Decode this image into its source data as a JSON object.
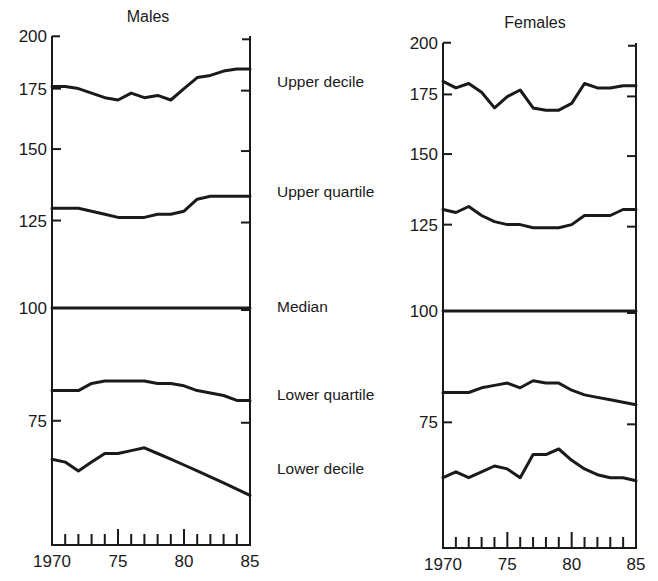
{
  "chart_data": [
    {
      "type": "line",
      "title": "Males",
      "xlabel": "",
      "ylabel": "",
      "yscale": "log",
      "ylim": [
        55,
        200
      ],
      "xlim": [
        1970,
        1985
      ],
      "yticks": [
        75,
        100,
        125,
        150,
        175,
        200
      ],
      "xtick_labels": [
        "1970",
        "75",
        "80",
        "85"
      ],
      "xticks": [
        1970,
        1975,
        1980,
        1985
      ],
      "minor_xticks_every": 1,
      "grid": false,
      "x": [
        1970,
        1971,
        1972,
        1973,
        1974,
        1975,
        1976,
        1977,
        1978,
        1979,
        1980,
        1981,
        1982,
        1983,
        1984,
        1985
      ],
      "series": [
        {
          "name": "Upper decile",
          "values": [
            176,
            176,
            175,
            173,
            171,
            170,
            173,
            171,
            172,
            170,
            175,
            180,
            181,
            183,
            184,
            184
          ]
        },
        {
          "name": "Upper quartile",
          "values": [
            129,
            129,
            129,
            128,
            127,
            126,
            126,
            126,
            127,
            127,
            128,
            132,
            133,
            133,
            133,
            133
          ]
        },
        {
          "name": "Median",
          "values": [
            100,
            100,
            100,
            100,
            100,
            100,
            100,
            100,
            100,
            100,
            100,
            100,
            100,
            100,
            100,
            100
          ]
        },
        {
          "name": "Lower quartile",
          "values": [
            81,
            81,
            81,
            82.5,
            83,
            83,
            83,
            83,
            82.5,
            82.5,
            82,
            81,
            80.5,
            80,
            79,
            79
          ]
        },
        {
          "name": "Lower decile",
          "values": [
            68,
            67.5,
            66,
            67.5,
            69,
            69,
            69.5,
            70,
            69,
            68,
            67,
            66,
            65,
            64,
            63,
            62
          ]
        }
      ]
    },
    {
      "type": "line",
      "title": "Females",
      "xlabel": "",
      "ylabel": "",
      "yscale": "log",
      "ylim": [
        55,
        200
      ],
      "xlim": [
        1970,
        1985
      ],
      "yticks": [
        75,
        100,
        125,
        150,
        175,
        200
      ],
      "xtick_labels": [
        "1970",
        "75",
        "80",
        "85"
      ],
      "xticks": [
        1970,
        1975,
        1980,
        1985
      ],
      "minor_xticks_every": 1,
      "grid": false,
      "x": [
        1970,
        1971,
        1972,
        1973,
        1974,
        1975,
        1976,
        1977,
        1978,
        1979,
        1980,
        1981,
        1982,
        1983,
        1984,
        1985
      ],
      "series": [
        {
          "name": "Upper decile",
          "values": [
            181,
            178,
            180,
            176,
            169,
            174,
            177,
            169,
            168,
            168,
            171,
            180,
            178,
            178,
            179,
            179
          ]
        },
        {
          "name": "Upper quartile",
          "values": [
            130,
            129,
            131,
            128,
            126,
            125,
            125,
            124,
            124,
            124,
            125,
            128,
            128,
            128,
            130,
            130
          ]
        },
        {
          "name": "Median",
          "values": [
            100,
            100,
            100,
            100,
            100,
            100,
            100,
            100,
            100,
            100,
            100,
            100,
            100,
            100,
            100,
            100
          ]
        },
        {
          "name": "Lower quartile",
          "values": [
            81,
            81,
            81,
            82,
            82.5,
            83,
            82,
            83.5,
            83,
            83,
            81.5,
            80.5,
            80,
            79.5,
            79,
            78.5
          ]
        },
        {
          "name": "Lower decile",
          "values": [
            65,
            66,
            65,
            66,
            67,
            66.5,
            65,
            69,
            69,
            70,
            68,
            66.5,
            65.5,
            65,
            65,
            64.5
          ]
        }
      ]
    }
  ],
  "figure": {
    "series_labels": [
      "Upper decile",
      "Upper quartile",
      "Median",
      "Lower quartile",
      "Lower decile"
    ],
    "series_label_y": [
      87,
      197,
      312,
      400,
      474
    ],
    "panels": [
      {
        "title": "Males",
        "plot": {
          "left": 52,
          "right": 250,
          "y100": 308,
          "ppl": 392
        },
        "title_x": 148,
        "title_y": 22,
        "axis_top": 36,
        "axis_bottom": 545
      },
      {
        "title": "Females",
        "plot": {
          "left": 443,
          "right": 636,
          "y100": 311,
          "ppl": 387
        },
        "title_x": 535,
        "title_y": 28,
        "axis_top": 43,
        "axis_bottom": 548
      }
    ],
    "colors": {
      "ink": "#1a1a1a",
      "background": "#ffffff"
    }
  }
}
